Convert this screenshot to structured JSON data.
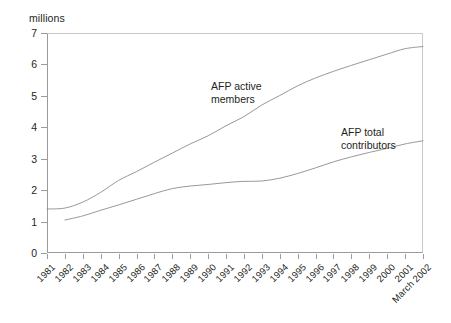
{
  "axis_caption": "millions",
  "annotations": {
    "active": "AFP active\nmembers",
    "active_line1": "AFP active",
    "active_line2": "members",
    "total_line1": "AFP total",
    "total_line2": "contributors"
  },
  "chart_data": {
    "type": "line",
    "title": "",
    "subtitle": "",
    "xlabel": "",
    "ylabel": "millions",
    "ylim": [
      0,
      7
    ],
    "yticks": [
      0,
      1,
      2,
      3,
      4,
      5,
      6,
      7
    ],
    "ytick_labels": [
      "0",
      "1",
      "2",
      "3",
      "4",
      "5",
      "6",
      "7"
    ],
    "grid": false,
    "legend": "inline-annotations",
    "categories": [
      "1981",
      "1982",
      "1983",
      "1984",
      "1985",
      "1986",
      "1987",
      "1988",
      "1989",
      "1990",
      "1991",
      "1992",
      "1993",
      "1994",
      "1995",
      "1996",
      "1997",
      "1998",
      "1999",
      "2000",
      "2001",
      "March 2002"
    ],
    "series": [
      {
        "name": "AFP active members",
        "color": "#8c8c8c",
        "values": [
          1.4,
          1.43,
          1.62,
          1.93,
          2.31,
          2.59,
          2.89,
          3.18,
          3.47,
          3.73,
          4.05,
          4.34,
          4.71,
          5.01,
          5.32,
          5.57,
          5.78,
          5.97,
          6.15,
          6.33,
          6.5,
          6.57
        ]
      },
      {
        "name": "AFP total contributors",
        "color": "#8c8c8c",
        "values": [
          null,
          1.05,
          1.18,
          1.36,
          1.53,
          1.71,
          1.89,
          2.05,
          2.13,
          2.18,
          2.24,
          2.28,
          2.29,
          2.38,
          2.53,
          2.71,
          2.9,
          3.06,
          3.2,
          3.33,
          3.47,
          3.57
        ]
      }
    ]
  }
}
